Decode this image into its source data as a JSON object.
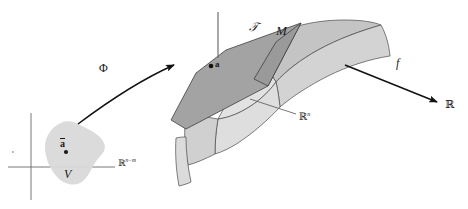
{
  "figure": {
    "width": 468,
    "height": 209,
    "background_color": "#ffffff"
  },
  "domain_panel": {
    "region_label": "V",
    "point_label": "ā",
    "point_label_plain": "a-bar",
    "axis_label": "ℝ",
    "axis_label_superscript": "n−m",
    "region_fill": "#d9d9d9",
    "axis_color": "#555555"
  },
  "manifold_panel": {
    "tangent_plane_label": "𝒯",
    "tangent_plane_label_plain": "T",
    "manifold_label": "M",
    "point_label": "a",
    "ambient_space_label": "ℝ",
    "ambient_space_superscript": "n",
    "tangent_plane_fill": "#a3a3a3",
    "manifold_fill": "#c9c9c9",
    "manifold_fill_light": "#dcdcdc",
    "outline_color": "#3a3a3a"
  },
  "arrows": {
    "phi": {
      "label": "Φ",
      "style": "curved",
      "color": "#111111"
    },
    "f": {
      "label": "f",
      "style": "straight",
      "color": "#111111"
    }
  },
  "codomain": {
    "label": "ℝ"
  }
}
